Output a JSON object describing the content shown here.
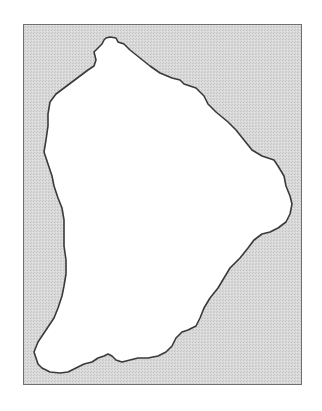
{
  "map": {
    "type": "outline-map",
    "region": "French Guiana",
    "colors": {
      "background": "#d6d6d6",
      "land": "#ffffff",
      "border": "#3a3a3a",
      "frame": "#707070"
    }
  }
}
